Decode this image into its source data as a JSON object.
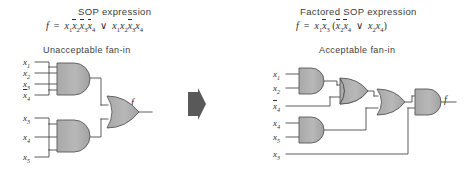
{
  "figure": {
    "width": 468,
    "height": 171,
    "background": "#ffffff",
    "wire_color": "#4a4a4a",
    "gate_fill": "#b4b4b4",
    "gate_stroke": "#555555",
    "arrow_color": "#555555"
  },
  "left": {
    "heading": "SOP expression",
    "formula": {
      "lhs": "f",
      "eq": "=",
      "term1": "x1 x2bar x3bar x4bar",
      "op": "∨",
      "term2": "x1 x2 x3bar x4"
    },
    "panel_title": "Unacceptable fan-in",
    "output_label": "f",
    "gate_top": {
      "type": "AND",
      "inputs": [
        "x1",
        "x2",
        "x3",
        "x4bar"
      ]
    },
    "gate_bottom": {
      "type": "AND",
      "inputs": [
        "x3",
        "x4",
        "x5"
      ]
    },
    "gate_out": {
      "type": "OR",
      "inputs": 2
    },
    "input_labels": [
      {
        "base": "x",
        "sub": "1",
        "bar": false
      },
      {
        "base": "x",
        "sub": "2",
        "bar": false
      },
      {
        "base": "x",
        "sub": "3",
        "bar": false
      },
      {
        "base": "x",
        "sub": "4",
        "bar": true
      },
      {
        "base": "x",
        "sub": "3",
        "bar": false
      },
      {
        "base": "x",
        "sub": "4",
        "bar": false
      },
      {
        "base": "x",
        "sub": "5",
        "bar": false
      }
    ]
  },
  "right": {
    "heading": "Factored SOP expression",
    "formula": {
      "lhs": "f",
      "eq": "=",
      "prefix": "x1 x3bar",
      "open": "(",
      "term1": "x2bar x4bar",
      "op": "∨",
      "term2": "x2 x4",
      "close": ")"
    },
    "panel_title": "Acceptable fan-in",
    "output_label": "f",
    "gates": [
      {
        "type": "AND",
        "inputs": [
          "x1",
          "x2"
        ]
      },
      {
        "type": "OR",
        "inputs": [
          "and1-out",
          "x4bar"
        ]
      },
      {
        "type": "OR",
        "inputs": [
          "or1-out",
          "and2-out"
        ]
      },
      {
        "type": "AND",
        "inputs": [
          "or2-out",
          "x3"
        ]
      },
      {
        "type": "AND",
        "inputs": [
          "x4",
          "x5"
        ]
      }
    ],
    "input_labels": [
      {
        "base": "x",
        "sub": "1",
        "bar": false
      },
      {
        "base": "x",
        "sub": "2",
        "bar": false
      },
      {
        "base": "x",
        "sub": "4",
        "bar": true
      },
      {
        "base": "x",
        "sub": "4",
        "bar": false
      },
      {
        "base": "x",
        "sub": "5",
        "bar": false
      },
      {
        "base": "x",
        "sub": "3",
        "bar": false
      }
    ]
  },
  "arrow": {
    "name": "transform-arrow",
    "direction": "right"
  }
}
